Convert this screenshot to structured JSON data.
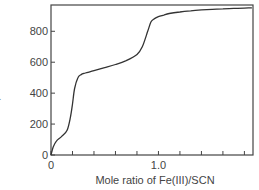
{
  "chart_data": {
    "type": "line",
    "title": "",
    "xlabel": "Mole ratio of Fe(III)/SCN",
    "ylabel_italic": "E",
    "ylabel_unit": ", mV",
    "ylabel": "E, mV",
    "xlim": [
      0,
      1.88
    ],
    "ylim": [
      0,
      970
    ],
    "xticks": [
      0,
      0.2,
      0.4,
      0.6,
      0.8,
      1.0,
      1.2,
      1.4,
      1.6,
      1.8
    ],
    "xtick_labels": [
      {
        "value": 0,
        "label": "0"
      },
      {
        "value": 1.0,
        "label": "1.0"
      }
    ],
    "yticks": [
      0,
      200,
      400,
      600,
      800
    ],
    "ytick_labels": [
      "0",
      "200",
      "400",
      "600",
      "800"
    ],
    "grid": false,
    "legend": null,
    "series": [
      {
        "name": "potentiometric titration curve",
        "color": "#333333",
        "x": [
          0,
          0.02,
          0.05,
          0.1,
          0.15,
          0.18,
          0.2,
          0.22,
          0.25,
          0.28,
          0.32,
          0.4,
          0.5,
          0.6,
          0.7,
          0.8,
          0.85,
          0.9,
          0.93,
          0.96,
          1.0,
          1.05,
          1.1,
          1.2,
          1.3,
          1.4,
          1.5,
          1.6,
          1.7,
          1.8,
          1.87
        ],
        "y": [
          0,
          50,
          90,
          120,
          160,
          240,
          330,
          430,
          500,
          520,
          530,
          545,
          565,
          585,
          610,
          650,
          700,
          800,
          860,
          880,
          895,
          905,
          915,
          925,
          932,
          938,
          942,
          945,
          948,
          950,
          952
        ]
      }
    ]
  }
}
